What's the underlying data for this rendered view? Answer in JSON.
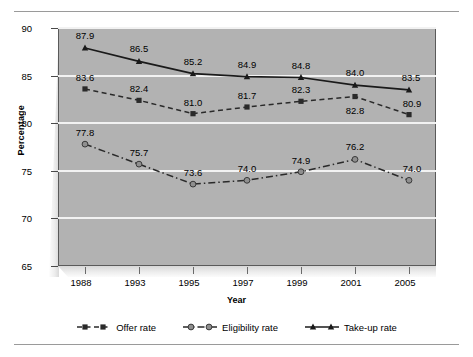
{
  "chart_data": {
    "type": "line",
    "title": "",
    "xlabel": "Year",
    "ylabel": "Percentage",
    "categories": [
      "1988",
      "1993",
      "1995",
      "1997",
      "1999",
      "2001",
      "2005"
    ],
    "ylim": [
      65,
      90
    ],
    "yticks": [
      "65",
      "70",
      "75",
      "80",
      "85",
      "90"
    ],
    "grid": true,
    "legend_position": "bottom",
    "series": [
      {
        "name": "Offer rate",
        "marker": "square",
        "line_style": "dashed",
        "color": "#2a2a2a",
        "values": [
          83.6,
          82.4,
          81.0,
          81.7,
          82.3,
          82.8,
          80.9
        ],
        "labels": [
          "83.6",
          "82.4",
          "81.0",
          "81.7",
          "82.3",
          "82.8",
          "80.9"
        ]
      },
      {
        "name": "Eligibility rate",
        "marker": "circle",
        "line_style": "dash-dot",
        "color": "#2a2a2a",
        "values": [
          77.8,
          75.7,
          73.6,
          74.0,
          74.9,
          76.2,
          74.0
        ],
        "labels": [
          "77.8",
          "75.7",
          "73.6",
          "74.0",
          "74.9",
          "76.2",
          "74.0"
        ]
      },
      {
        "name": "Take-up rate",
        "marker": "triangle",
        "line_style": "solid",
        "color": "#1a1a1a",
        "values": [
          87.9,
          86.5,
          85.2,
          84.9,
          84.8,
          84.0,
          83.5
        ],
        "labels": [
          "87.9",
          "86.5",
          "85.2",
          "84.9",
          "84.8",
          "84.0",
          "83.5"
        ]
      }
    ],
    "colors": {
      "plot_background": "#b2b2b2",
      "gridline": "#f2f2f2",
      "axis": "#4a4a4a",
      "text": "#000000",
      "rule": "#9a9a9a"
    }
  }
}
